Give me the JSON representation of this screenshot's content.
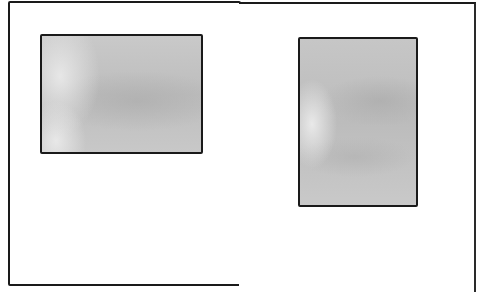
{
  "diagram": {
    "pages": [
      {
        "id": "left",
        "orientation": "portrait page",
        "inner_block": {
          "shape": "rectangle",
          "orientation": "landscape",
          "fill": "#c4c4c4",
          "position": "upper area"
        }
      },
      {
        "id": "right",
        "orientation": "portrait page",
        "inner_block": {
          "shape": "rectangle",
          "orientation": "portrait",
          "fill": "#c2c2c2",
          "position": "upper-center area"
        }
      }
    ],
    "colors": {
      "background": "#ffffff",
      "outline": "#1a1a1a",
      "shade": "#c4c4c4"
    }
  }
}
